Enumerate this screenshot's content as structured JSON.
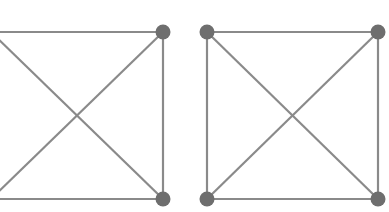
{
  "diagram": {
    "title": "",
    "colors": {
      "edge": "#8a8a8a",
      "node": "#6e6e6e",
      "background": "#ffffff"
    },
    "graphs": [
      {
        "name": "K4 graph (left, partially cropped)",
        "nodes": [
          {
            "id": "A",
            "x": -9,
            "y": 32,
            "visible": false
          },
          {
            "id": "B",
            "x": 163,
            "y": 32,
            "visible": true
          },
          {
            "id": "C",
            "x": -9,
            "y": 199,
            "visible": false
          },
          {
            "id": "D",
            "x": 163,
            "y": 199,
            "visible": true
          }
        ],
        "edges": [
          [
            "A",
            "B"
          ],
          [
            "C",
            "D"
          ],
          [
            "B",
            "D"
          ],
          [
            "A",
            "C"
          ],
          [
            "A",
            "D"
          ],
          [
            "B",
            "C"
          ]
        ]
      },
      {
        "name": "K4 graph (right)",
        "nodes": [
          {
            "id": "A",
            "x": 207,
            "y": 32,
            "visible": true
          },
          {
            "id": "B",
            "x": 378,
            "y": 32,
            "visible": true
          },
          {
            "id": "C",
            "x": 207,
            "y": 199,
            "visible": true
          },
          {
            "id": "D",
            "x": 378,
            "y": 199,
            "visible": true
          }
        ],
        "edges": [
          [
            "A",
            "B"
          ],
          [
            "C",
            "D"
          ],
          [
            "A",
            "C"
          ],
          [
            "B",
            "D"
          ],
          [
            "A",
            "D"
          ],
          [
            "B",
            "C"
          ]
        ]
      }
    ]
  }
}
